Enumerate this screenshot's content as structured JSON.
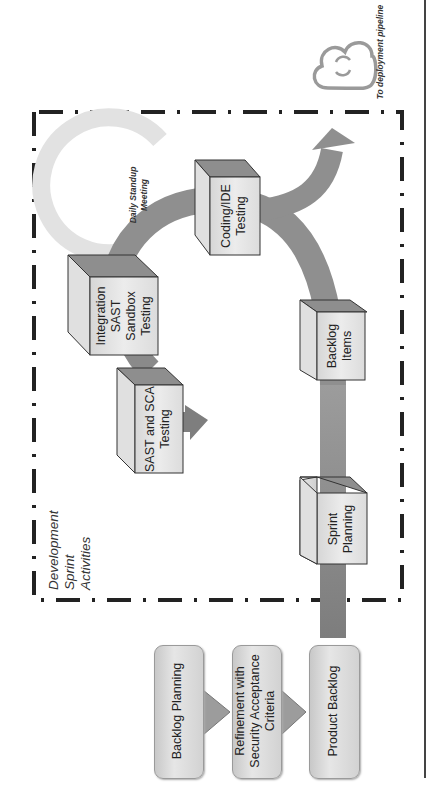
{
  "diagram": {
    "orientation": "rotated -90deg (text reads bottom-to-top)",
    "container": {
      "label_lines": [
        "Development",
        "Sprint",
        "Activities"
      ],
      "border_style": "dash-dot"
    },
    "deployment": {
      "label": "To deployment pipeline",
      "icon": "cloud-sync-icon"
    },
    "standup": {
      "label_lines": [
        "Daily Standup",
        "Meeting"
      ],
      "icon": "circular-arrow-icon"
    },
    "cubes": [
      {
        "id": "sprint-planning",
        "lines": [
          "Sprint",
          "Planning"
        ]
      },
      {
        "id": "backlog-items",
        "lines": [
          "Backlog",
          "Items"
        ]
      },
      {
        "id": "coding-ide-testing",
        "lines": [
          "Coding/IDE",
          "Testing"
        ]
      },
      {
        "id": "integration-sast-sandbox-testing",
        "lines": [
          "Integration",
          "SAST",
          "Sandbox",
          "Testing"
        ]
      },
      {
        "id": "sast-sca-testing",
        "lines": [
          "SAST and SCA",
          "Testing"
        ]
      }
    ],
    "steps": [
      {
        "id": "backlog-planning",
        "lines": [
          "Backlog Planning"
        ]
      },
      {
        "id": "refinement",
        "lines": [
          "Refinement with",
          "Security Acceptance",
          "Criteria"
        ]
      },
      {
        "id": "product-backlog",
        "lines": [
          "Product Backlog"
        ]
      }
    ],
    "colors": {
      "flow_arrow": "#8c8c8c",
      "cube_front": "#e4e4e4",
      "cube_top": "#8e8e8e",
      "cube_side": "#d4d4d4",
      "standup_arc": "#e2e2e2",
      "cloud": "#9a9a9a",
      "border": "#222222"
    }
  }
}
